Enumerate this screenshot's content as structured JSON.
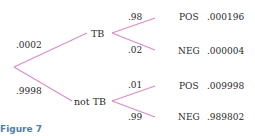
{
  "diagram": {
    "type": "probability-tree",
    "line_color": "#d98cc8",
    "root_branches": [
      {
        "prob": ".0002",
        "node": "TB",
        "children": [
          {
            "prob": ".98",
            "outcome": "POS",
            "joint": ".000196"
          },
          {
            "prob": ".02",
            "outcome": "NEG",
            "joint": ".000004"
          }
        ]
      },
      {
        "prob": ".9998",
        "node": "not TB",
        "children": [
          {
            "prob": ".01",
            "outcome": "POS",
            "joint": ".009998"
          },
          {
            "prob": ".99",
            "outcome": "NEG",
            "joint": ".989802"
          }
        ]
      }
    ]
  },
  "caption": "Figure 7"
}
